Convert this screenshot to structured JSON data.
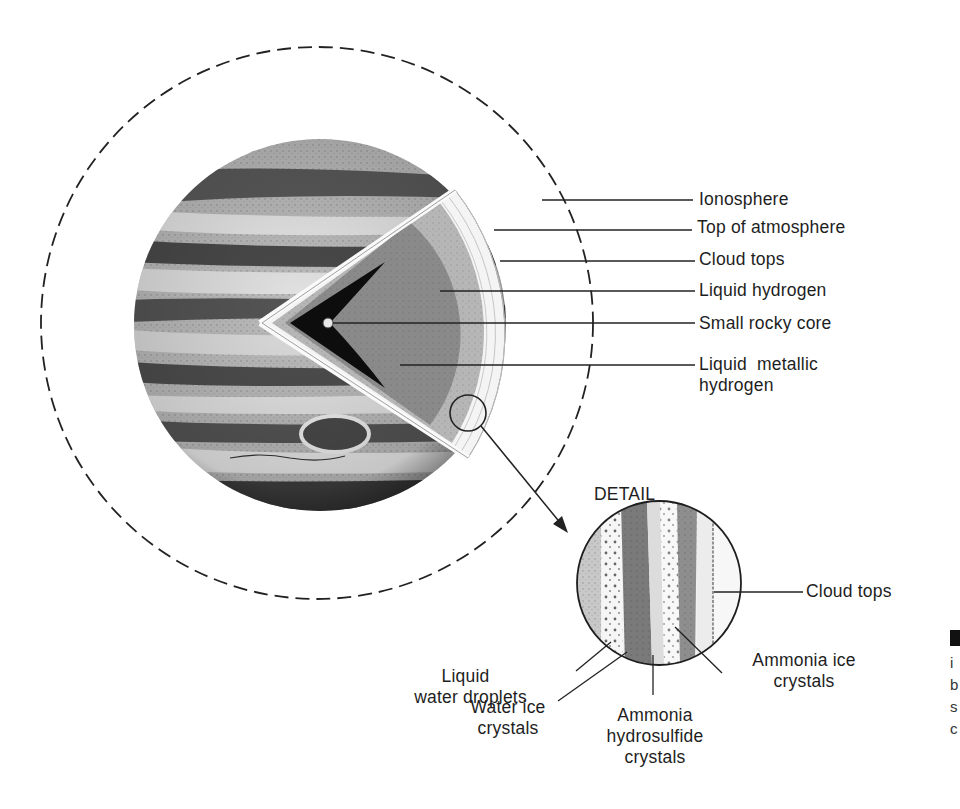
{
  "diagram": {
    "main_labels": {
      "ionosphere": "Ionosphere",
      "top_of_atmosphere": "Top of atmosphere",
      "cloud_tops": "Cloud tops",
      "liquid_hydrogen": "Liquid hydrogen",
      "small_rocky_core": "Small rocky core",
      "liquid_metallic_hydrogen_1": "Liquid  metallic",
      "liquid_metallic_hydrogen_2": "hydrogen"
    },
    "detail": {
      "heading": "DETAIL",
      "labels": {
        "cloud_tops": "Cloud tops",
        "liquid_water_droplets_1": "Liquid",
        "liquid_water_droplets_2": "water droplets",
        "water_ice_crystals_1": "Water ice",
        "water_ice_crystals_2": "crystals",
        "ammonia_hydrosulfide_1": "Ammonia",
        "ammonia_hydrosulfide_2": "hydrosulfide",
        "ammonia_hydrosulfide_3": "crystals",
        "ammonia_ice_crystals_1": "Ammonia ice",
        "ammonia_ice_crystals_2": "crystals"
      }
    },
    "caption_fragment": [
      "i",
      "b",
      "s",
      "c"
    ],
    "colors": {
      "ink": "#1e1e1e",
      "band_dark": "#4a4a4a",
      "band_light": "#d8d8d8",
      "core_dark": "#0d0d0d",
      "mantle": "#8a8a8a",
      "liquid_h": "#b4b4b4"
    }
  }
}
